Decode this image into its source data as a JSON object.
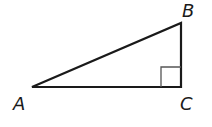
{
  "diagram": {
    "type": "right-triangle",
    "vertices": {
      "A": {
        "label": "A",
        "x": 32,
        "y": 87
      },
      "B": {
        "label": "B",
        "x": 181,
        "y": 23
      },
      "C": {
        "label": "C",
        "x": 181,
        "y": 87
      }
    },
    "right_angle_at": "C",
    "colors": {
      "stroke": "#1a1a1a",
      "marker": "#555555"
    }
  }
}
